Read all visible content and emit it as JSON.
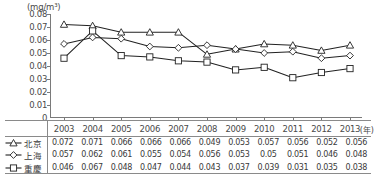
{
  "chart_data": {
    "type": "line",
    "title": "",
    "subtitle": "",
    "xlabel": "(年)",
    "ylabel": "(mg/m³)",
    "unit_label": "(mg/m³)",
    "x_unit_label": "(年)",
    "categories": [
      "2003",
      "2004",
      "2005",
      "2006",
      "2007",
      "2008",
      "2009",
      "2010",
      "2011",
      "2012",
      "2013"
    ],
    "ylim": [
      0,
      0.08
    ],
    "y_ticks": [
      "0.08",
      "0.07",
      "0.06",
      "0.05",
      "0.04",
      "0.03",
      "0.02",
      "0.01",
      "0"
    ],
    "y_tick_values": [
      0.08,
      0.07,
      0.06,
      0.05,
      0.04,
      0.03,
      0.02,
      0.01,
      0
    ],
    "grid": false,
    "legend_position": "table-left",
    "series": [
      {
        "name": "北京",
        "marker": "triangle",
        "color": "#222222",
        "values": [
          0.072,
          0.071,
          0.066,
          0.066,
          0.066,
          0.049,
          0.053,
          0.057,
          0.056,
          0.052,
          0.056
        ],
        "labels": [
          "0.072",
          "0.071",
          "0.066",
          "0.066",
          "0.066",
          "0.049",
          "0.053",
          "0.057",
          "0.056",
          "0.052",
          "0.056"
        ]
      },
      {
        "name": "上海",
        "marker": "diamond",
        "color": "#222222",
        "values": [
          0.057,
          0.062,
          0.061,
          0.055,
          0.054,
          0.056,
          0.053,
          0.05,
          0.051,
          0.046,
          0.048
        ],
        "labels": [
          "0.057",
          "0.062",
          "0.061",
          "0.055",
          "0.054",
          "0.056",
          "0.053",
          "0.05",
          "0.051",
          "0.046",
          "0.048"
        ]
      },
      {
        "name": "重慶",
        "marker": "square",
        "color": "#222222",
        "values": [
          0.046,
          0.067,
          0.048,
          0.047,
          0.044,
          0.043,
          0.037,
          0.039,
          0.031,
          0.035,
          0.038
        ],
        "labels": [
          "0.046",
          "0.067",
          "0.048",
          "0.047",
          "0.044",
          "0.043",
          "0.037",
          "0.039",
          "0.031",
          "0.035",
          "0.038"
        ]
      }
    ]
  }
}
